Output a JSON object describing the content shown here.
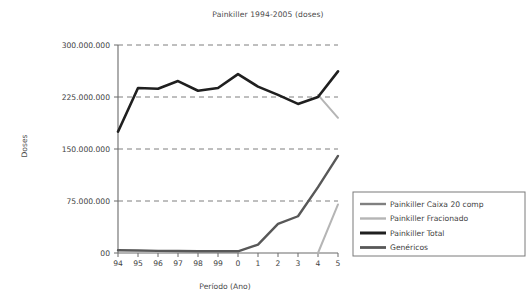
{
  "chart_data": {
    "type": "line",
    "title": "Painkiller 1994-2005 (doses)",
    "xlabel": "Período (Ano)",
    "ylabel": "Doses",
    "grid": true,
    "legend_position": "right",
    "x": [
      "94",
      "95",
      "96",
      "97",
      "98",
      "99",
      "0",
      "1",
      "2",
      "3",
      "4",
      "5"
    ],
    "categories": [
      "94",
      "95",
      "96",
      "97",
      "98",
      "99",
      "0",
      "1",
      "2",
      "3",
      "4",
      "5"
    ],
    "xtick_labels": [
      "94",
      "95",
      "96",
      "97",
      "98",
      "99",
      "0",
      "1",
      "2",
      "3",
      "4",
      "5"
    ],
    "ytick_labels": [
      "00",
      "75.000.000",
      "150.000.000",
      "225.000.000",
      "300.000.000"
    ],
    "ytick_values": [
      0,
      75000000,
      150000000,
      225000000,
      300000000
    ],
    "ylim": [
      0,
      300000000
    ],
    "series": [
      {
        "name": "Painkiller Caixa 20 comp",
        "color": "#808080",
        "width": 2.0,
        "values": [
          null,
          null,
          null,
          null,
          null,
          null,
          null,
          null,
          null,
          null,
          null,
          null
        ]
      },
      {
        "name": "Painkiller Fracionado",
        "color": "#b5b5b5",
        "width": 2.0,
        "values": [
          null,
          null,
          null,
          null,
          null,
          null,
          null,
          null,
          null,
          null,
          228000000,
          195000000
        ]
      },
      {
        "name": "Painkiller Total",
        "color": "#1f1f1f",
        "width": 2.6,
        "values": [
          175000000,
          238000000,
          237000000,
          248000000,
          234000000,
          238000000,
          258000000,
          240000000,
          228000000,
          215000000,
          225000000,
          262000000
        ]
      },
      {
        "name": "Genéricos",
        "color": "#585858",
        "width": 2.4,
        "values": [
          4000000,
          3500000,
          3000000,
          2800000,
          2600000,
          2500000,
          2500000,
          12000000,
          42000000,
          53000000,
          95000000,
          140000000
        ]
      }
    ],
    "extra_series": [
      {
        "name": "Painkiller Fracionado (lower branch)",
        "color": "#b5b5b5",
        "width": 2.0,
        "values": [
          null,
          null,
          null,
          null,
          null,
          null,
          null,
          null,
          null,
          null,
          0,
          70000000
        ]
      }
    ],
    "legend_entries": [
      {
        "label": "Painkiller Caixa 20 comp",
        "color": "#808080",
        "width": 2.4
      },
      {
        "label": "Painkiller Fracionado",
        "color": "#b5b5b5",
        "width": 2.4
      },
      {
        "label": "Painkiller Total",
        "color": "#1f1f1f",
        "width": 3.0
      },
      {
        "label": "Genéricos",
        "color": "#585858",
        "width": 2.8
      }
    ]
  }
}
